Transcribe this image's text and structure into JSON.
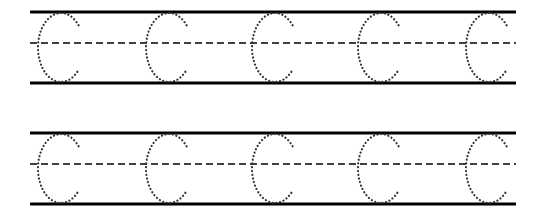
{
  "worksheet": {
    "title": "Letter C tracing practice",
    "letter": "C",
    "rows": [
      {
        "letters": [
          "C",
          "C",
          "C",
          "C",
          "C"
        ]
      },
      {
        "letters": [
          "C",
          "C",
          "C",
          "C",
          "C"
        ]
      }
    ],
    "colors": {
      "line": "#000000",
      "dots": "#333333",
      "background": "#ffffff"
    }
  }
}
